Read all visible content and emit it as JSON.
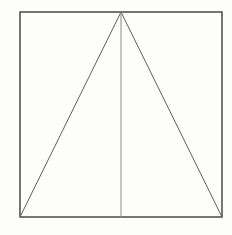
{
  "figure": {
    "canvas": {
      "width": 232,
      "height": 235,
      "background": "#fdfdfc"
    },
    "colors": {
      "square_stroke": "#3c3c3c",
      "triangle_stroke": "#5f5f5f",
      "median_stroke": "#8a8a8a"
    },
    "shapes": [
      {
        "name": "square-outline",
        "type": "rect",
        "x": 20,
        "y": 12,
        "width": 202,
        "height": 205,
        "stroke": "#3c3c3c",
        "stroke_width": 1.4,
        "fill": "none"
      },
      {
        "name": "triangle-left-side",
        "type": "line",
        "x1": 121,
        "y1": 12,
        "x2": 20,
        "y2": 217,
        "stroke": "#5f5f5f",
        "stroke_width": 1
      },
      {
        "name": "triangle-right-side",
        "type": "line",
        "x1": 121,
        "y1": 12,
        "x2": 222,
        "y2": 217,
        "stroke": "#5f5f5f",
        "stroke_width": 1
      },
      {
        "name": "vertical-median",
        "type": "line",
        "x1": 121,
        "y1": 12,
        "x2": 121,
        "y2": 217,
        "stroke": "#8a8a8a",
        "stroke_width": 1
      }
    ]
  }
}
